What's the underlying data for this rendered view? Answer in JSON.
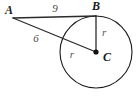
{
  "figure": {
    "background_color": "#ffffff",
    "stroke_color": "#1a1a1a",
    "label_color": "#4a4a4a",
    "circle": {
      "center_label": "C",
      "center_x": 96,
      "center_y": 52,
      "radius": 36,
      "stroke_color": "#1a1a1a",
      "stroke_width": 1.1,
      "fill": "none"
    },
    "points": [
      {
        "id": "A",
        "label": "A",
        "x": 13,
        "y": 18,
        "label_x": 9,
        "label_y": 14,
        "dot": false
      },
      {
        "id": "B",
        "label": "B",
        "x": 96,
        "y": 16,
        "label_x": 96,
        "label_y": 10,
        "dot": false
      },
      {
        "id": "C",
        "label": "C",
        "x": 96,
        "y": 52,
        "label_x": 103,
        "label_y": 61,
        "dot": true
      }
    ],
    "segments": [
      {
        "id": "AB",
        "name": "tangent-segment-ab",
        "from": "A",
        "to": "B",
        "x1": 13,
        "y1": 18,
        "x2": 96,
        "y2": 16,
        "label": "9",
        "label_x": 55,
        "label_y": 12,
        "stroke_color": "#2b2b2b",
        "stroke_width": 1.3
      },
      {
        "id": "AC",
        "name": "secant-segment-ac",
        "from": "A",
        "to": "C",
        "x1": 13,
        "y1": 18,
        "x2": 96,
        "y2": 52,
        "label": "6",
        "label_x": 36,
        "label_y": 42,
        "stroke_color": "#2b2b2b",
        "stroke_width": 1.3
      },
      {
        "id": "BC",
        "name": "radius-segment-bc",
        "from": "B",
        "to": "C",
        "x1": 96,
        "y1": 16,
        "x2": 96,
        "y2": 52,
        "label": "r",
        "label_x": 102,
        "label_y": 36,
        "stroke_color": "#2b2b2b",
        "stroke_width": 1.3
      }
    ],
    "radius_labels": [
      {
        "id": "r-vertical",
        "text": "r",
        "x": 102,
        "y": 36
      },
      {
        "id": "r-diagonal",
        "text": "r",
        "x": 72,
        "y": 58
      }
    ],
    "center_dot": {
      "x": 96,
      "y": 52,
      "r": 2.6,
      "color": "#111111"
    }
  }
}
